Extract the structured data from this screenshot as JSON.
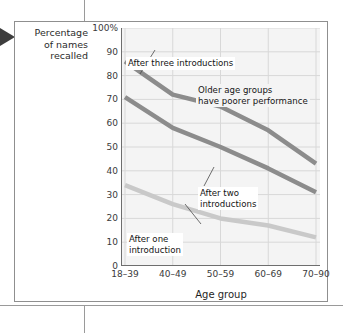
{
  "page": {
    "pointer_icon": "left-pointer-triangle"
  },
  "chart_data": {
    "type": "line",
    "title": "",
    "xlabel": "Age group",
    "ylabel": "Percentage of names recalled",
    "ylabel_lines": [
      "Percentage",
      "of names",
      "recalled"
    ],
    "categories": [
      "18–39",
      "40–49",
      "50–59",
      "60–69",
      "70–90"
    ],
    "ylim": [
      0,
      100
    ],
    "ytick_labels": [
      "100%",
      "90",
      "80",
      "70",
      "60",
      "50",
      "40",
      "30",
      "20",
      "10",
      "0"
    ],
    "ytick_values": [
      100,
      90,
      80,
      70,
      60,
      50,
      40,
      30,
      20,
      10,
      0
    ],
    "grid": true,
    "legend": "annotations",
    "series": [
      {
        "name": "After three introductions",
        "values": [
          86,
          72,
          67,
          57,
          43
        ],
        "color": "#8c8c8c"
      },
      {
        "name": "After two introductions",
        "values": [
          71,
          58,
          50,
          41,
          31
        ],
        "color": "#8c8c8c"
      },
      {
        "name": "After one introduction",
        "values": [
          34,
          26,
          20,
          17,
          12
        ],
        "color": "#c9c9c9"
      }
    ],
    "annotations": [
      {
        "id": "three",
        "text": "After three introductions"
      },
      {
        "id": "older",
        "line1": "Older age groups",
        "line2": "have poorer performance"
      },
      {
        "id": "two",
        "line1": "After two",
        "line2": "introductions"
      },
      {
        "id": "one",
        "line1": "After one",
        "line2": "introduction"
      }
    ],
    "colors": {
      "plot_background": "#f4f4f4",
      "gridline": "#d8d8d8",
      "axis": "#6e6e6e",
      "series_dark": "#8c8c8c",
      "series_light": "#c9c9c9"
    }
  }
}
